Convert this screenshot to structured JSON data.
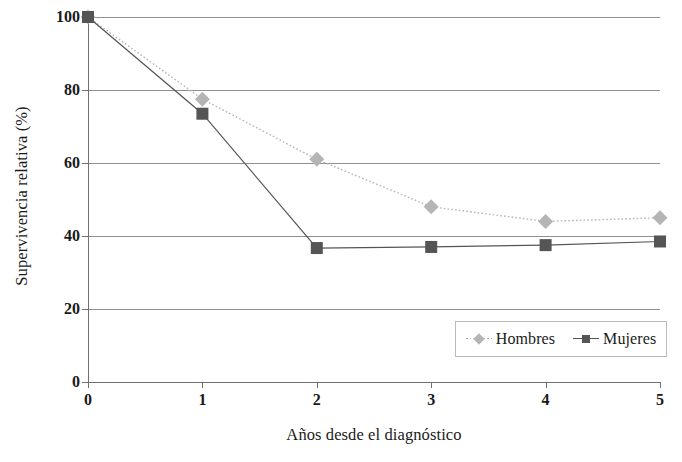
{
  "chart_data": {
    "type": "line",
    "title": "",
    "xlabel": "Años desde el diagnóstico",
    "ylabel": "Supervivencia relativa (%)",
    "x": [
      0,
      1,
      2,
      3,
      4,
      5
    ],
    "xticklabels": [
      "0",
      "1",
      "2",
      "3",
      "4",
      "5"
    ],
    "yticklabels": [
      "0",
      "20",
      "40",
      "60",
      "80",
      "100"
    ],
    "yticks": [
      0,
      20,
      40,
      60,
      80,
      100
    ],
    "xlim": [
      0,
      5
    ],
    "ylim": [
      0,
      100
    ],
    "grid": "horizontal",
    "legend_position": "bottom-right",
    "series": [
      {
        "name": "Hombres",
        "values": [
          100,
          77.5,
          61,
          48,
          44,
          45
        ],
        "marker": "diamond",
        "color": "#b5b5b5",
        "linestyle": "dotted"
      },
      {
        "name": "Mujeres",
        "values": [
          100,
          73.5,
          36.7,
          37,
          37.5,
          38.5
        ],
        "marker": "square",
        "color": "#555555",
        "linestyle": "solid"
      }
    ]
  },
  "legend": {
    "entries": [
      {
        "label": "Hombres"
      },
      {
        "label": "Mujeres"
      }
    ]
  },
  "colors": {
    "hombres": "#b5b5b5",
    "mujeres": "#555555",
    "gridline": "#909090",
    "axis": "#707070",
    "text": "#1a1a1a",
    "background": "#ffffff"
  }
}
